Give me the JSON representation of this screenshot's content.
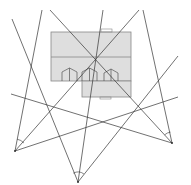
{
  "diagram": {
    "background": "#ffffff",
    "stroke_color": "#333333",
    "building_fill": "#dedede",
    "building_stroke": "#888888",
    "building": {
      "main": {
        "x": 51,
        "y": 32,
        "w": 80,
        "h": 49
      },
      "lower": {
        "x": 82,
        "y": 81,
        "w": 49,
        "h": 16
      },
      "divider_y": 57,
      "top_tab": {
        "x": 101,
        "y": 29,
        "w": 11,
        "h": 3
      },
      "bottom_tab": {
        "x": 100,
        "y": 97,
        "w": 11,
        "h": 2
      },
      "arches": [
        {
          "x": 62,
          "y": 81,
          "w": 15,
          "peak": 68
        },
        {
          "x": 82,
          "y": 81,
          "w": 15,
          "peak": 68
        },
        {
          "x": 104,
          "y": 81,
          "w": 14,
          "peak": 69
        }
      ]
    },
    "vertices": [
      {
        "name": "bottom-left",
        "x": 15,
        "y": 151
      },
      {
        "name": "bottom-center",
        "x": 78,
        "y": 182
      },
      {
        "name": "bottom-right",
        "x": 172,
        "y": 143
      }
    ],
    "lines": [
      {
        "x1": 15,
        "y1": 151,
        "x2": 42,
        "y2": 10
      },
      {
        "x1": 15,
        "y1": 151,
        "x2": 139,
        "y2": 10
      },
      {
        "x1": 15,
        "y1": 151,
        "x2": 178,
        "y2": 97
      },
      {
        "x1": 78,
        "y1": 182,
        "x2": 12,
        "y2": 19
      },
      {
        "x1": 78,
        "y1": 182,
        "x2": 103,
        "y2": 10
      },
      {
        "x1": 78,
        "y1": 182,
        "x2": 178,
        "y2": 56
      },
      {
        "x1": 172,
        "y1": 143,
        "x2": 50,
        "y2": 10
      },
      {
        "x1": 172,
        "y1": 143,
        "x2": 143,
        "y2": 10
      },
      {
        "x1": 172,
        "y1": 143,
        "x2": 11,
        "y2": 94
      }
    ],
    "angle_arcs": [
      {
        "cx": 15,
        "cy": 151,
        "r": 12,
        "from": 280,
        "to": 318
      },
      {
        "cx": 78,
        "cy": 182,
        "r": 10,
        "from": 242,
        "to": 306
      },
      {
        "cx": 172,
        "cy": 143,
        "r": 11,
        "from": 228,
        "to": 262
      }
    ]
  }
}
